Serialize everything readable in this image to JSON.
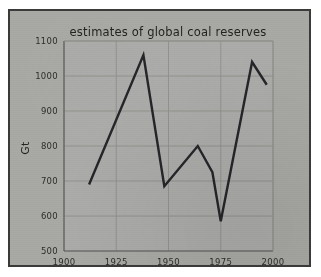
{
  "figure": {
    "background_color": "#ffffff",
    "card_color": "#a9a9a6",
    "border_color": "#3a3a38",
    "line_color": "#26262a",
    "grid_color": "#8e8e8b"
  },
  "chart_data": {
    "type": "line",
    "title": "estimates of global coal reserves",
    "xlabel": "",
    "ylabel": "Gt",
    "xlim": [
      1900,
      2000
    ],
    "ylim": [
      500,
      1100
    ],
    "xticks": [
      1900,
      1925,
      1950,
      1975,
      2000
    ],
    "xticklabels": [
      "1900",
      "1925",
      "1950",
      "1975",
      "2000"
    ],
    "yticks": [
      500,
      600,
      700,
      800,
      900,
      1000,
      1100
    ],
    "yticklabels": [
      "500",
      "600",
      "700",
      "800",
      "900",
      "1000",
      "1100"
    ],
    "grid": true,
    "legend": false,
    "series": [
      {
        "name": "estimates of global coal reserves",
        "x": [
          1912,
          1938,
          1948,
          1964,
          1971,
          1975,
          1990,
          1997
        ],
        "values": [
          690,
          1060,
          685,
          800,
          725,
          585,
          1040,
          975
        ]
      }
    ]
  }
}
